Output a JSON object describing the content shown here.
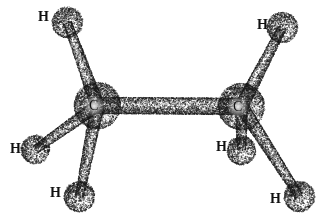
{
  "figure": {
    "style": "stippled engraving ball-and-stick diagram",
    "width": 324,
    "height": 222,
    "background_color": "#ffffff",
    "ink_color": "#1a1a1a"
  },
  "molecule": {
    "formula": "C2H6",
    "name": "Ethane",
    "carbon_label": "C",
    "hydrogen_label": "H",
    "atoms": [
      {
        "id": "c-left",
        "element": "C",
        "label": "C",
        "cx": 97,
        "cy": 105,
        "r": 23,
        "label_x": 89,
        "label_y": 99,
        "shade_seed": 11
      },
      {
        "id": "c-right",
        "element": "C",
        "label": "C",
        "cx": 241,
        "cy": 106,
        "r": 23,
        "label_x": 233,
        "label_y": 100,
        "shade_seed": 23
      },
      {
        "id": "h-top-left",
        "element": "H",
        "label": "H",
        "cx": 67,
        "cy": 22,
        "r": 15,
        "label_x": 38,
        "label_y": 10,
        "shade_seed": 31
      },
      {
        "id": "h-mid-left",
        "element": "H",
        "label": "H",
        "cx": 35,
        "cy": 149,
        "r": 14,
        "label_x": 10,
        "label_y": 142,
        "shade_seed": 47
      },
      {
        "id": "h-bottom-left",
        "element": "H",
        "label": "H",
        "cx": 79,
        "cy": 196,
        "r": 15,
        "label_x": 50,
        "label_y": 186,
        "shade_seed": 59
      },
      {
        "id": "h-top-right",
        "element": "H",
        "label": "H",
        "cx": 282,
        "cy": 27,
        "r": 15,
        "label_x": 257,
        "label_y": 18,
        "shade_seed": 67
      },
      {
        "id": "h-mid-right",
        "element": "H",
        "label": "H",
        "cx": 241,
        "cy": 150,
        "r": 14,
        "label_x": 216,
        "label_y": 140,
        "shade_seed": 79
      },
      {
        "id": "h-bottom-right",
        "element": "H",
        "label": "H",
        "cx": 299,
        "cy": 196,
        "r": 15,
        "label_x": 270,
        "label_y": 192,
        "shade_seed": 83
      }
    ],
    "bonds": [
      {
        "id": "bond-c-c",
        "from": "c-left",
        "to": "c-right",
        "w1": 16,
        "w2": 16,
        "seed": 101
      },
      {
        "id": "bond-c-left-h-top-left",
        "from": "c-left",
        "to": "h-top-left",
        "w1": 13,
        "w2": 8,
        "seed": 103
      },
      {
        "id": "bond-c-left-h-mid-left",
        "from": "c-left",
        "to": "h-mid-left",
        "w1": 12,
        "w2": 8,
        "seed": 107
      },
      {
        "id": "bond-c-left-h-bottom-left",
        "from": "c-left",
        "to": "h-bottom-left",
        "w1": 13,
        "w2": 8,
        "seed": 109
      },
      {
        "id": "bond-c-right-h-top-right",
        "from": "c-right",
        "to": "h-top-right",
        "w1": 13,
        "w2": 8,
        "seed": 113
      },
      {
        "id": "bond-c-right-h-mid-right",
        "from": "c-right",
        "to": "h-mid-right",
        "w1": 12,
        "w2": 8,
        "seed": 127
      },
      {
        "id": "bond-c-right-h-bottom-right",
        "from": "c-right",
        "to": "h-bottom-right",
        "w1": 13,
        "w2": 8,
        "seed": 131
      }
    ]
  }
}
